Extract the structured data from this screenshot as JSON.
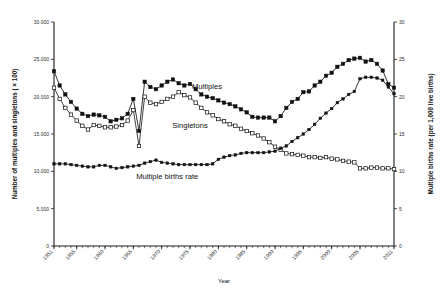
{
  "figure": {
    "background": "#ffffff",
    "ink_color": "#111111"
  },
  "chart_data": {
    "type": "line",
    "title": "",
    "xlabel": "Year",
    "ylabel": "Number of multiples and singletons ( × 100)",
    "y2label": "Multiple births rate (per 1,000 live births)",
    "xlim": [
      1951,
      2011
    ],
    "ylim": [
      0,
      30000
    ],
    "y2lim": [
      0,
      30
    ],
    "grid": false,
    "legend_position": "inline-annotations",
    "x_tick_labels": [
      "1951",
      "1955",
      "1960",
      "1965",
      "1970",
      "1975",
      "1980",
      "1985",
      "1990",
      "1995",
      "2000",
      "2005",
      "2011"
    ],
    "x_tick_values": [
      1951,
      1955,
      1960,
      1965,
      1970,
      1975,
      1980,
      1985,
      1990,
      1995,
      2000,
      2005,
      2011
    ],
    "y_tick_labels": [
      "0",
      "5,000",
      "10,000",
      "15,000",
      "20,000",
      "25,000",
      "30,000"
    ],
    "y_tick_values": [
      0,
      5000,
      10000,
      15000,
      20000,
      25000,
      30000
    ],
    "y2_tick_labels": [
      "0",
      "5",
      "10",
      "15",
      "20",
      "25",
      "30"
    ],
    "y2_tick_values": [
      0,
      5,
      10,
      15,
      20,
      25,
      30
    ],
    "x": [
      1951,
      1952,
      1953,
      1954,
      1955,
      1956,
      1957,
      1958,
      1959,
      1960,
      1961,
      1962,
      1963,
      1964,
      1965,
      1966,
      1967,
      1968,
      1969,
      1970,
      1971,
      1972,
      1973,
      1974,
      1975,
      1976,
      1977,
      1978,
      1979,
      1980,
      1981,
      1982,
      1983,
      1984,
      1985,
      1986,
      1987,
      1988,
      1989,
      1990,
      1991,
      1992,
      1993,
      1994,
      1995,
      1996,
      1997,
      1998,
      1999,
      2000,
      2001,
      2002,
      2003,
      2004,
      2005,
      2006,
      2007,
      2008,
      2009,
      2010,
      2011
    ],
    "series": [
      {
        "name": "Multiples",
        "marker": "filled-square",
        "axis": "left",
        "annotation": "Multiples",
        "annotation_x": 1978,
        "annotation_y": 21000,
        "values": [
          23400,
          21500,
          20300,
          19300,
          18400,
          17700,
          17400,
          17600,
          17500,
          17300,
          16700,
          16900,
          17100,
          17700,
          19700,
          15400,
          22000,
          21300,
          21000,
          21500,
          22000,
          22300,
          21800,
          21500,
          21700,
          21000,
          20300,
          20000,
          19800,
          19500,
          19200,
          19000,
          18700,
          18300,
          17900,
          17300,
          17200,
          17200,
          17200,
          16700,
          17400,
          18500,
          19300,
          19700,
          20600,
          20700,
          21500,
          22000,
          22800,
          23200,
          24000,
          24400,
          24900,
          25100,
          25200,
          24700,
          24900,
          24400,
          23500,
          21700,
          21200
        ]
      },
      {
        "name": "Singletons",
        "marker": "open-square",
        "axis": "left",
        "annotation": "Singletons",
        "annotation_x": 1975,
        "annotation_y": 15800,
        "values": [
          21200,
          19700,
          18500,
          17600,
          16800,
          16100,
          15600,
          16200,
          16100,
          15900,
          15900,
          16000,
          16200,
          16800,
          18200,
          13400,
          20000,
          19200,
          19000,
          19300,
          19700,
          20000,
          20600,
          20200,
          19900,
          19200,
          18500,
          17900,
          17500,
          17000,
          16700,
          16300,
          16100,
          15700,
          15400,
          15100,
          14800,
          14400,
          13900,
          13300,
          12900,
          12400,
          12300,
          12200,
          12100,
          11900,
          11900,
          11800,
          11900,
          11700,
          11600,
          11400,
          11300,
          11200,
          10400,
          10400,
          10500,
          10500,
          10400,
          10400,
          10300
        ]
      },
      {
        "name": "Multiple births rate",
        "marker": "filled-small",
        "axis": "right",
        "annotation": "Multiple births rate",
        "annotation_x": 1971,
        "annotation_y": 9.0,
        "values": [
          11.0,
          11.0,
          11.0,
          10.9,
          10.8,
          10.7,
          10.6,
          10.6,
          10.8,
          10.8,
          10.6,
          10.4,
          10.5,
          10.6,
          10.7,
          10.8,
          11.1,
          11.3,
          11.5,
          11.2,
          11.1,
          11.0,
          10.9,
          10.9,
          10.9,
          10.9,
          10.9,
          10.9,
          11.0,
          11.6,
          11.9,
          12.1,
          12.2,
          12.4,
          12.5,
          12.5,
          12.5,
          12.5,
          12.6,
          12.7,
          13.1,
          13.4,
          14.0,
          14.5,
          15.0,
          15.6,
          16.3,
          17.1,
          17.8,
          18.4,
          19.2,
          19.7,
          20.3,
          20.7,
          22.4,
          22.6,
          22.6,
          22.5,
          22.2,
          21.3,
          20.4
        ]
      }
    ]
  }
}
